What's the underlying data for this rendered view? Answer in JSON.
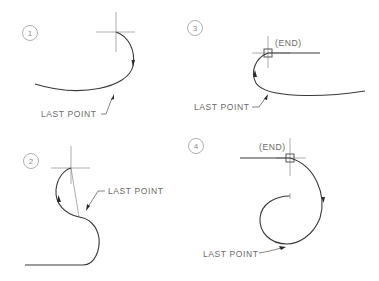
{
  "diagram": {
    "panels": [
      {
        "id": "1",
        "number": "1",
        "last_point_label": "LAST POINT",
        "end_label": null
      },
      {
        "id": "3",
        "number": "3",
        "last_point_label": "LAST POINT",
        "end_label": "(END)"
      },
      {
        "id": "2",
        "number": "2",
        "last_point_label": "LAST POINT",
        "end_label": null
      },
      {
        "id": "4",
        "number": "4",
        "last_point_label": "LAST POINT",
        "end_label": "(END)"
      }
    ],
    "colors": {
      "curve": "#3a3a3a",
      "construction": "#8a8a8a",
      "text": "#6a6a6a",
      "background": "#ffffff"
    }
  }
}
